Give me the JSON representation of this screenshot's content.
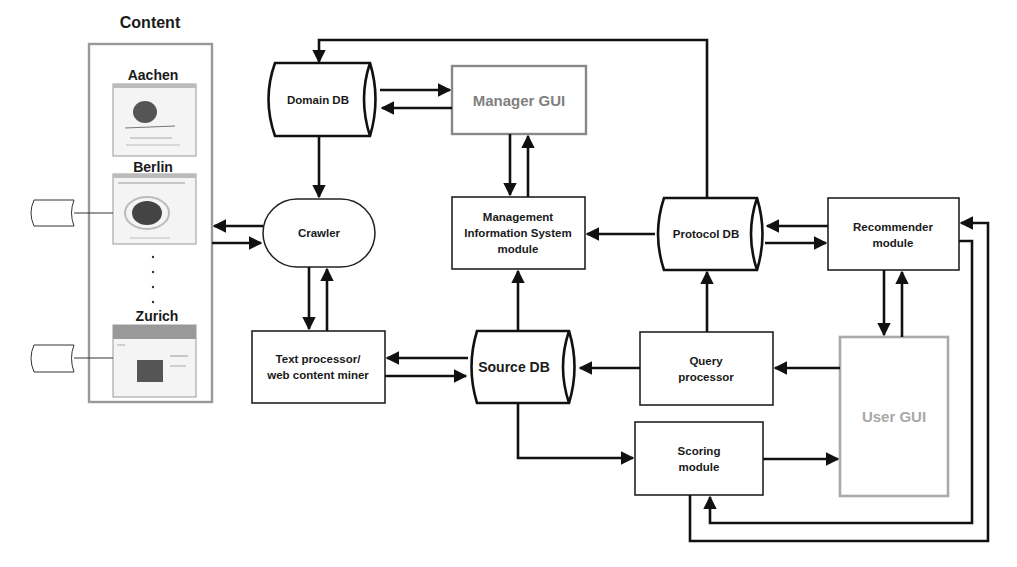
{
  "diagram": {
    "content_panel": {
      "title": "Content",
      "cities": [
        "Aachen",
        "Berlin",
        "Zurich"
      ],
      "ellipsis": "· · · ·"
    },
    "nodes": {
      "domain_db": {
        "label": "Domain DB",
        "shape": "cylinder"
      },
      "manager_gui": {
        "label": "Manager GUI",
        "shape": "box",
        "color": "#808080"
      },
      "crawler": {
        "label": "Crawler",
        "shape": "stadium"
      },
      "mis": {
        "lines": [
          "Management",
          "Information System",
          "module"
        ],
        "shape": "box"
      },
      "protocol_db": {
        "label": "Protocol DB",
        "shape": "cylinder"
      },
      "recommender": {
        "lines": [
          "Recommender",
          "module"
        ],
        "shape": "box"
      },
      "text_processor": {
        "lines": [
          "Text processor/",
          "web content miner"
        ],
        "shape": "box"
      },
      "source_db": {
        "label": "Source DB",
        "shape": "cylinder"
      },
      "query_processor": {
        "lines": [
          "Query",
          "processor"
        ],
        "shape": "box"
      },
      "user_gui": {
        "label": "User GUI",
        "shape": "box",
        "color": "#a8a8a8"
      },
      "scoring": {
        "lines": [
          "Scoring",
          "module"
        ],
        "shape": "box"
      }
    },
    "edges": [
      {
        "from": "Protocol DB",
        "to": "Domain DB"
      },
      {
        "from": "Domain DB",
        "to": "Manager GUI"
      },
      {
        "from": "Manager GUI",
        "to": "Domain DB"
      },
      {
        "from": "Domain DB",
        "to": "Crawler"
      },
      {
        "from": "Manager GUI",
        "to": "Management Information System module"
      },
      {
        "from": "Management Information System module",
        "to": "Manager GUI"
      },
      {
        "from": "Crawler",
        "to": "Content"
      },
      {
        "from": "Content",
        "to": "Crawler"
      },
      {
        "from": "Crawler",
        "to": "Text processor/web content miner"
      },
      {
        "from": "Text processor/web content miner",
        "to": "Crawler"
      },
      {
        "from": "Protocol DB",
        "to": "Management Information System module"
      },
      {
        "from": "Source DB",
        "to": "Management Information System module"
      },
      {
        "from": "Source DB",
        "to": "Text processor/web content miner"
      },
      {
        "from": "Text processor/web content miner",
        "to": "Source DB"
      },
      {
        "from": "Recommender module",
        "to": "Protocol DB"
      },
      {
        "from": "Protocol DB",
        "to": "Recommender module"
      },
      {
        "from": "Query processor",
        "to": "Protocol DB"
      },
      {
        "from": "Query processor",
        "to": "Source DB"
      },
      {
        "from": "User GUI",
        "to": "Query processor"
      },
      {
        "from": "Recommender module",
        "to": "User GUI"
      },
      {
        "from": "User GUI",
        "to": "Recommender module"
      },
      {
        "from": "Source DB",
        "to": "Scoring module"
      },
      {
        "from": "Scoring module",
        "to": "User GUI"
      },
      {
        "from": "Recommender module",
        "to": "Scoring module"
      },
      {
        "from": "Scoring module",
        "to": "Recommender module"
      }
    ]
  }
}
